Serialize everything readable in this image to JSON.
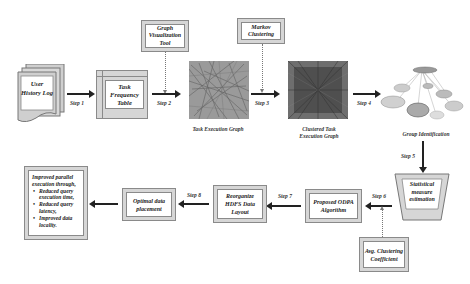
{
  "diagram": {
    "top_row": {
      "user_history_log": "User History Log",
      "task_frequency_table": "Task Frequency Table",
      "graph_visualization_tool": "Graph Visualization Tool",
      "markov_clustering": "Markov Clustering",
      "task_execution_graph_caption": "Task Execution Graph",
      "clustered_graph_caption": "Clustered Task Execution Graph",
      "group_identification_caption": "Group Identification"
    },
    "steps": {
      "step1": "Step 1",
      "step2": "Step 2",
      "step3": "Step 3",
      "step4": "Step 4",
      "step5": "Step 5",
      "step6": "Step 6",
      "step7": "Step 7",
      "step8": "Step 8"
    },
    "bottom_row": {
      "statistical_measure": "Statistical measure estimation",
      "avg_clustering": "Avg. Clustering Coefficient",
      "proposed_odpa": "Proposed ODPA Algorithm",
      "reorganize_hdfs": "Reorganize HDFS Data Layout",
      "optimal_placement": "Optimal data placement",
      "result": {
        "heading": "Improved parallel execution through,",
        "bullets": [
          "Reduced query execution time,",
          "Reduced query latency,",
          "Improved data locality."
        ]
      }
    },
    "colors": {
      "frame_fill": "#d6d6d6",
      "border": "#8a8a8a",
      "arrow": "#222222",
      "dotted_connector": "#777777"
    }
  }
}
